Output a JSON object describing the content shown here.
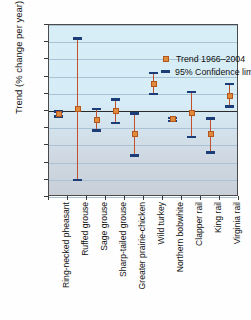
{
  "chart_data": {
    "type": "scatter",
    "title": "",
    "xlabel": "",
    "ylabel": "Trend (% change per year)",
    "ylim": [
      -25,
      25
    ],
    "yticks": [
      25,
      20,
      15,
      10,
      5,
      0,
      -5,
      -10,
      -15,
      -20,
      -25
    ],
    "ytick_labels": [
      "25",
      "20",
      "15",
      "10",
      "5",
      "0",
      "-5",
      "-10",
      "-15",
      "-20",
      "-25"
    ],
    "grid": true,
    "legend_position": "top-right-inside",
    "legend": [
      {
        "label": "Trend 1966–2004",
        "marker": "square",
        "color": "#e08a3c"
      },
      {
        "label": "95% Confidence limits",
        "marker": "dash",
        "color": "#1d3d78"
      }
    ],
    "categories": [
      "Ring-necked pheasant",
      "Ruffed grouse",
      "Sage grouse",
      "Sharp-tailed grouse",
      "Greater prairie-chicken",
      "Wild turkey",
      "Northern bobwhite",
      "Clapper rail",
      "King rail",
      "Virginia rail"
    ],
    "series": [
      {
        "name": "Trend 1966–2004",
        "values": [
          -0.8,
          0.5,
          -2.5,
          -0.1,
          -6.7,
          7.8,
          -2.4,
          -0.7,
          -6.8,
          4.5
        ]
      }
    ],
    "error_bars": {
      "name": "95% Confidence limits",
      "lower": [
        -1.6,
        -20.0,
        -5.6,
        -3.5,
        -13.0,
        5.0,
        -2.9,
        -7.6,
        -12.0,
        1.3
      ],
      "upper": [
        -0.2,
        21.1,
        0.6,
        3.3,
        -0.8,
        11.0,
        -2.0,
        5.5,
        -2.2,
        7.8
      ]
    }
  }
}
